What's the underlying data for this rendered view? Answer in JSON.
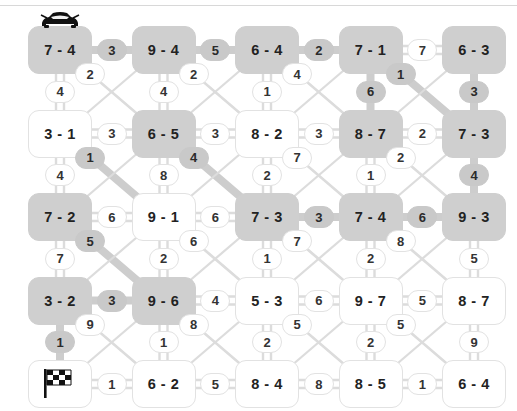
{
  "puzzle": {
    "title": "route-grid-puzzle",
    "type": "racing-route-grid",
    "grid": {
      "rows": 5,
      "cols": 5
    },
    "colors": {
      "highlight": "#cfcfcf",
      "edge_highlight": "#c9c9c9",
      "node_plain": "#ffffff",
      "border": "#e2e2e2",
      "text": "#222222",
      "wire": "#dcdcdc",
      "wire_highlight": "#cdcdcd"
    },
    "start_icon": "car-icon",
    "goal_icon": "checkered-flag-icon",
    "nodes": [
      [
        {
          "label": "7 - 4",
          "highlight": true,
          "icon": "car-icon"
        },
        {
          "label": "9 - 4",
          "highlight": true,
          "icon": null
        },
        {
          "label": "6 - 4",
          "highlight": true,
          "icon": null
        },
        {
          "label": "7 - 1",
          "highlight": true,
          "icon": null
        },
        {
          "label": "6 - 3",
          "highlight": true,
          "icon": null
        }
      ],
      [
        {
          "label": "3 - 1",
          "highlight": false,
          "icon": null
        },
        {
          "label": "6 - 5",
          "highlight": true,
          "icon": null
        },
        {
          "label": "8 - 2",
          "highlight": false,
          "icon": null
        },
        {
          "label": "8 - 7",
          "highlight": true,
          "icon": null
        },
        {
          "label": "7 - 3",
          "highlight": true,
          "icon": null
        }
      ],
      [
        {
          "label": "7 - 2",
          "highlight": true,
          "icon": null
        },
        {
          "label": "9 - 1",
          "highlight": false,
          "icon": null
        },
        {
          "label": "7 - 3",
          "highlight": true,
          "icon": null
        },
        {
          "label": "7 - 4",
          "highlight": true,
          "icon": null
        },
        {
          "label": "9 - 3",
          "highlight": true,
          "icon": null
        }
      ],
      [
        {
          "label": "3 - 2",
          "highlight": true,
          "icon": null
        },
        {
          "label": "9 - 6",
          "highlight": true,
          "icon": null
        },
        {
          "label": "5 - 3",
          "highlight": false,
          "icon": null
        },
        {
          "label": "9 - 7",
          "highlight": false,
          "icon": null
        },
        {
          "label": "8 - 7",
          "highlight": false,
          "icon": null
        }
      ],
      [
        {
          "label": "",
          "highlight": false,
          "icon": "checkered-flag-icon"
        },
        {
          "label": "6 - 2",
          "highlight": false,
          "icon": null
        },
        {
          "label": "8 - 4",
          "highlight": false,
          "icon": null
        },
        {
          "label": "8 - 5",
          "highlight": false,
          "icon": null
        },
        {
          "label": "6 - 4",
          "highlight": false,
          "icon": null
        }
      ]
    ],
    "horizontal_edges": [
      [
        {
          "label": "3",
          "highlight": true
        },
        {
          "label": "5",
          "highlight": true
        },
        {
          "label": "2",
          "highlight": true
        },
        {
          "label": "7",
          "highlight": false
        }
      ],
      [
        {
          "label": "3",
          "highlight": false
        },
        {
          "label": "3",
          "highlight": false
        },
        {
          "label": "3",
          "highlight": false
        },
        {
          "label": "2",
          "highlight": false
        }
      ],
      [
        {
          "label": "6",
          "highlight": false
        },
        {
          "label": "6",
          "highlight": false
        },
        {
          "label": "3",
          "highlight": true
        },
        {
          "label": "6",
          "highlight": true
        }
      ],
      [
        {
          "label": "3",
          "highlight": true
        },
        {
          "label": "4",
          "highlight": false
        },
        {
          "label": "6",
          "highlight": false
        },
        {
          "label": "5",
          "highlight": false
        }
      ],
      [
        {
          "label": "1",
          "highlight": false
        },
        {
          "label": "5",
          "highlight": false
        },
        {
          "label": "8",
          "highlight": false
        },
        {
          "label": "1",
          "highlight": false
        }
      ]
    ],
    "vertical_edges": [
      [
        {
          "label": "4",
          "highlight": false
        },
        {
          "label": "4",
          "highlight": false
        },
        {
          "label": "1",
          "highlight": false
        },
        {
          "label": "6",
          "highlight": true
        },
        {
          "label": "3",
          "highlight": true
        }
      ],
      [
        {
          "label": "4",
          "highlight": false
        },
        {
          "label": "8",
          "highlight": false
        },
        {
          "label": "2",
          "highlight": false
        },
        {
          "label": "1",
          "highlight": false
        },
        {
          "label": "4",
          "highlight": true
        }
      ],
      [
        {
          "label": "7",
          "highlight": false
        },
        {
          "label": "2",
          "highlight": false
        },
        {
          "label": "1",
          "highlight": false
        },
        {
          "label": "2",
          "highlight": false
        },
        {
          "label": "5",
          "highlight": false
        }
      ],
      [
        {
          "label": "1",
          "highlight": true
        },
        {
          "label": "1",
          "highlight": false
        },
        {
          "label": "2",
          "highlight": false
        },
        {
          "label": "2",
          "highlight": false
        },
        {
          "label": "9",
          "highlight": false
        }
      ]
    ],
    "diagonal_edges": [
      {
        "label": "2",
        "row": 0,
        "col": 0,
        "dir": "dr",
        "highlight": false
      },
      {
        "label": "2",
        "row": 0,
        "col": 1,
        "dir": "dr",
        "highlight": false
      },
      {
        "label": "4",
        "row": 0,
        "col": 2,
        "dir": "dr",
        "highlight": false
      },
      {
        "label": "1",
        "row": 0,
        "col": 3,
        "dir": "dr",
        "highlight": true
      },
      {
        "label": "1",
        "row": 1,
        "col": 0,
        "dir": "dr",
        "highlight": true
      },
      {
        "label": "4",
        "row": 1,
        "col": 1,
        "dir": "dr",
        "highlight": true
      },
      {
        "label": "7",
        "row": 1,
        "col": 2,
        "dir": "dr",
        "highlight": false
      },
      {
        "label": "2",
        "row": 1,
        "col": 3,
        "dir": "dr",
        "highlight": false
      },
      {
        "label": "5",
        "row": 2,
        "col": 0,
        "dir": "dr",
        "highlight": true
      },
      {
        "label": "6",
        "row": 2,
        "col": 1,
        "dir": "dr",
        "highlight": false
      },
      {
        "label": "7",
        "row": 2,
        "col": 2,
        "dir": "dr",
        "highlight": false
      },
      {
        "label": "8",
        "row": 2,
        "col": 3,
        "dir": "dr",
        "highlight": false
      },
      {
        "label": "9",
        "row": 3,
        "col": 0,
        "dir": "dr",
        "highlight": false
      },
      {
        "label": "8",
        "row": 3,
        "col": 1,
        "dir": "dr",
        "highlight": false
      },
      {
        "label": "5",
        "row": 3,
        "col": 2,
        "dir": "dr",
        "highlight": false
      },
      {
        "label": "5",
        "row": 3,
        "col": 3,
        "dir": "dr",
        "highlight": false
      }
    ],
    "route": [
      "7 - 4",
      "3",
      "9 - 4",
      "5",
      "6 - 4",
      "2",
      "7 - 1",
      "6",
      "8 - 7",
      "1",
      "6 - 3",
      "3",
      "7 - 3",
      "4",
      "9 - 3",
      "6",
      "7 - 4",
      "3",
      "7 - 3",
      "4",
      "6 - 5",
      "1",
      "7 - 2",
      "5",
      "9 - 6",
      "3",
      "3 - 2",
      "1",
      "goal"
    ]
  }
}
